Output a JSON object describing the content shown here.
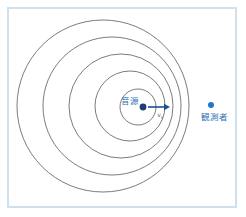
{
  "figure": {
    "kind": "doppler-effect-diagram",
    "background_color": "#ffffff",
    "frame": {
      "border_color": "#cfe0ef",
      "border_width_px": 2,
      "x": 7,
      "y": 7,
      "width": 230,
      "height": 201
    }
  },
  "labels": {
    "source": "音源",
    "observer": "観測者",
    "velocity_symbol": "v",
    "velocity_subscript": "s"
  },
  "colors": {
    "wavefront_stroke": "#5a5a5a",
    "source_dot": "#1f3f73",
    "observer_dot": "#1f77d0",
    "arrow": "#1f4f96",
    "label_text": "#2e6fb7",
    "frame_border": "#cfe0ef"
  },
  "source": {
    "label": "音源",
    "dot_x": 143,
    "dot_y": 107,
    "dot_radius": 3.4,
    "label_x": 139,
    "label_y": 104
  },
  "observer": {
    "label": "観測者",
    "dot_x": 211,
    "dot_y": 105,
    "dot_radius": 3.0,
    "label_x": 214,
    "label_y": 120
  },
  "velocity_arrow": {
    "x1": 148,
    "y1": 107,
    "x2": 170,
    "y2": 107,
    "head_length": 6,
    "head_half_width": 3.2,
    "label_x": 160,
    "label_y": 117
  },
  "wavefronts": [
    {
      "index": 1,
      "cx": 103,
      "cy": 106,
      "r": 86
    },
    {
      "index": 2,
      "cx": 112,
      "cy": 106,
      "r": 69
    },
    {
      "index": 3,
      "cx": 121,
      "cy": 106,
      "r": 52
    },
    {
      "index": 4,
      "cx": 130,
      "cy": 106,
      "r": 35
    },
    {
      "index": 5,
      "cx": 138,
      "cy": 107,
      "r": 18
    }
  ]
}
